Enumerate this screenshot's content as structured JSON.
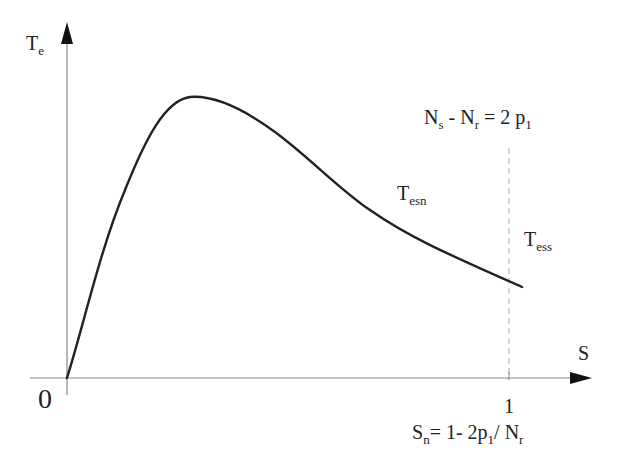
{
  "diagram": {
    "type": "torque-slip curve",
    "y_axis": {
      "label_main": "T",
      "label_sub": "e"
    },
    "x_axis": {
      "label": "S",
      "origin_label": "0",
      "tick_label": "1"
    },
    "curve_label": {
      "main": "T",
      "sub": "esn"
    },
    "synchronous_label": {
      "main": "T",
      "sub": "ess"
    },
    "condition_label": {
      "n_s": "N",
      "n_s_sub": "s",
      "minus": " - ",
      "n_r": "N",
      "n_r_sub": "r",
      "eq": " = 2 p",
      "p_sub": "1"
    },
    "slip_label": {
      "s": "S",
      "s_sub": "n",
      "eq": "= 1- 2p",
      "p_sub": "1",
      "div": "/ N",
      "n_sub": "r"
    },
    "colors": {
      "curve": "#222222",
      "axis": "#777777",
      "dashed": "#aaaaaa",
      "arrow": "#111111"
    }
  }
}
